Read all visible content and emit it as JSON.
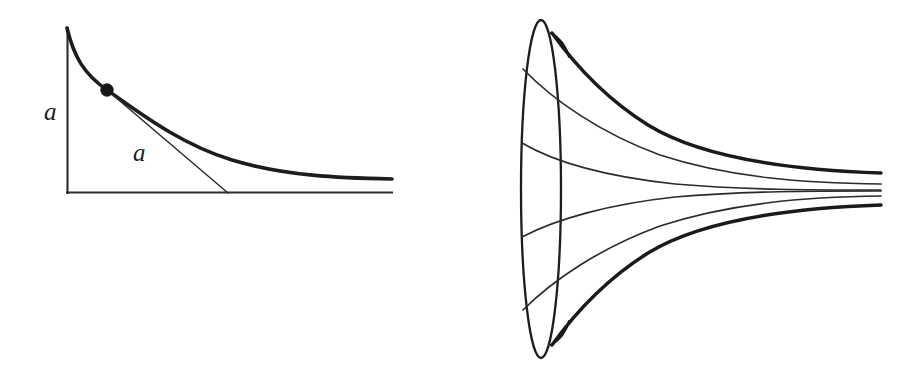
{
  "figure": {
    "background_color": "#ffffff",
    "ink_color": "#1d1d1d",
    "width": 923,
    "height": 379
  },
  "left_panel": {
    "name": "tractrix-diagram",
    "caption": "",
    "labels": [
      {
        "id": "label-a-vertical",
        "text": "a",
        "x": 46,
        "y": 120,
        "meaning": "length-a-on-y-axis"
      },
      {
        "id": "label-a-tangent",
        "text": "a",
        "x": 134,
        "y": 160,
        "meaning": "constant-tangent-length-a"
      }
    ],
    "axes": {
      "origin": {
        "x": 67,
        "y": 193
      },
      "y_axis_top": {
        "x": 67,
        "y": 28
      },
      "x_axis_right": {
        "x": 392,
        "y": 193
      },
      "stroke_color": "#2b2b2b"
    },
    "curve": {
      "id": "tractrix",
      "stroke_color": "#1d1d1d",
      "start": {
        "x": 67,
        "y": 28
      },
      "end": {
        "x": 392,
        "y": 179
      },
      "path": "M 67 28 C 74 57, 84 74, 107 90 C 140 113, 180 144, 232 160 C 285 176, 340 178, 392 179"
    },
    "tangent": {
      "id": "tangent-segment",
      "from": {
        "x": 107,
        "y": 90
      },
      "to": {
        "x": 228,
        "y": 193
      },
      "length_label": "a"
    },
    "point": {
      "id": "tangency-point",
      "x": 107,
      "y": 90,
      "radius": 6.2,
      "fill": "#161616"
    }
  },
  "right_panel": {
    "name": "pseudosphere-diagram",
    "caption": "",
    "rim": {
      "id": "left-rim-ellipse",
      "cx": 541,
      "cy": 189,
      "rx": 20,
      "ry": 169,
      "stroke_color": "#1d1d1d"
    },
    "tip": {
      "x": 881,
      "y": 189
    },
    "profiles_bold": [
      {
        "id": "profile-top-bold",
        "path": "M 552 33 C 570 58, 600 95, 648 125 C 700 157, 790 170, 881 173",
        "cusp_hook": "M 552 33 C 561 37, 566 44, 568 55"
      },
      {
        "id": "profile-bottom-bold",
        "path": "M 552 345 C 570 320, 600 283, 648 253 C 700 221, 790 208, 881 205",
        "cusp_hook": "M 552 345 C 561 341, 566 334, 568 323"
      }
    ],
    "profiles_thin": [
      {
        "id": "profile-thin-1",
        "attach_y": 69,
        "path": "M 523 69 C 553 100, 600 133, 660 155 C 730 178, 805 183, 881 184"
      },
      {
        "id": "profile-thin-2",
        "attach_y": 143,
        "path": "M 522 143 C 556 163, 610 177, 675 184 C 745 190, 812 190, 881 190"
      },
      {
        "id": "profile-thin-3",
        "attach_y": 237,
        "path": "M 522 237 C 556 219, 610 204, 675 197 C 745 191, 812 191, 881 191"
      },
      {
        "id": "profile-thin-4",
        "attach_y": 310,
        "path": "M 523 310 C 553 280, 600 248, 660 226 C 730 203, 805 197, 881 196"
      }
    ]
  }
}
